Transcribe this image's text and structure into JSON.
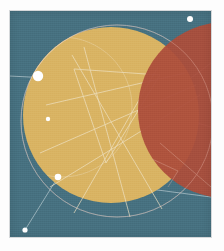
{
  "artwork": {
    "title": "Abstract Geometric Composition",
    "medium": "Flat vector poster",
    "canvas": {
      "width": 201,
      "height": 226,
      "background_color": "#46707f",
      "margin_color": "#fdfdfd"
    },
    "palette": {
      "background_teal": "#46707f",
      "circle_gold": "#d9b362",
      "circle_rust": "#ab4d3a",
      "overlap_dark_rust": "#a44734",
      "line_white": "#e8eef0",
      "node_white": "#ffffff"
    },
    "shapes": [
      {
        "name": "gold-circle",
        "type": "circle",
        "cx": 101,
        "cy": 104,
        "r": 88,
        "fill": "#d9b362",
        "opacity": 1
      },
      {
        "name": "rust-circle",
        "type": "circle",
        "cx": 216,
        "cy": 99,
        "r": 88,
        "fill": "#ab4d3a",
        "opacity": 0.94
      }
    ],
    "guide_arcs": [
      {
        "name": "large-outline-circle",
        "cx": 107,
        "cy": 110,
        "r": 96
      },
      {
        "name": "inner-outline-circle",
        "cx": 96,
        "cy": 104,
        "r": 80
      }
    ],
    "nodes": [
      {
        "name": "node-upper-left",
        "cx": 28,
        "cy": 65,
        "r": 5.2
      },
      {
        "name": "node-mid-left",
        "cx": 38,
        "cy": 108,
        "r": 2.2
      },
      {
        "name": "node-lower-left",
        "cx": 48,
        "cy": 166,
        "r": 3.3
      },
      {
        "name": "node-bottom-corner",
        "cx": 15,
        "cy": 219,
        "r": 2.6
      },
      {
        "name": "node-top-right",
        "cx": 180,
        "cy": 8,
        "r": 3.0
      }
    ],
    "connector_lines": [
      {
        "name": "connector-upperleft-to-midleft",
        "x1": 28,
        "y1": 65,
        "x2": 38,
        "y2": 108
      },
      {
        "name": "connector-midleft-to-lowerleft",
        "x1": 38,
        "y1": 108,
        "x2": 48,
        "y2": 166
      },
      {
        "name": "connector-lowerleft-to-corner",
        "x1": 48,
        "y1": 166,
        "x2": 15,
        "y2": 219
      },
      {
        "name": "connector-upperleft-horizontal",
        "x1": 0,
        "y1": 65,
        "x2": 150,
        "y2": 73
      },
      {
        "name": "connector-upperleft-to-right",
        "x1": 28,
        "y1": 65,
        "x2": 201,
        "y2": 116
      },
      {
        "name": "connector-lowerleft-to-upperright",
        "x1": 48,
        "y1": 166,
        "x2": 201,
        "y2": 52
      },
      {
        "name": "connector-lowerleft-to-rightedge",
        "x1": 48,
        "y1": 166,
        "x2": 201,
        "y2": 186
      }
    ],
    "crossing_lines": [
      {
        "name": "chord-a",
        "x1": 36,
        "y1": 94,
        "x2": 175,
        "y2": 62
      },
      {
        "name": "chord-b",
        "x1": 62,
        "y1": 44,
        "x2": 152,
        "y2": 198
      },
      {
        "name": "chord-c",
        "x1": 30,
        "y1": 142,
        "x2": 186,
        "y2": 74
      },
      {
        "name": "chord-d",
        "x1": 148,
        "y1": 56,
        "x2": 64,
        "y2": 202
      },
      {
        "name": "chord-e",
        "x1": 40,
        "y1": 176,
        "x2": 190,
        "y2": 84
      },
      {
        "name": "chord-f",
        "x1": 74,
        "y1": 36,
        "x2": 120,
        "y2": 206
      },
      {
        "name": "triangle-edge-top",
        "x1": 64,
        "y1": 58,
        "x2": 150,
        "y2": 64
      },
      {
        "name": "triangle-edge-right",
        "x1": 150,
        "y1": 64,
        "x2": 96,
        "y2": 152
      },
      {
        "name": "triangle-edge-left",
        "x1": 96,
        "y1": 152,
        "x2": 64,
        "y2": 58
      }
    ],
    "accent_polyline": {
      "name": "rust-field-chevron",
      "points": "142,148 168,160 158,176"
    }
  }
}
